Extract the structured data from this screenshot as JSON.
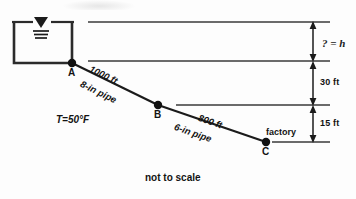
{
  "diagram": {
    "caption": "not to scale",
    "reservoir": {
      "name": "reservoir-tank",
      "water_surface_symbol": "water-surface-triangle",
      "temperature_label": "T=50°F"
    },
    "nodes": [
      {
        "id": "A",
        "label": "A",
        "x": 72,
        "y": 63
      },
      {
        "id": "B",
        "label": "B",
        "x": 158,
        "y": 105
      },
      {
        "id": "C",
        "label": "C",
        "x": 266,
        "y": 142
      }
    ],
    "pipes": [
      {
        "from": "A",
        "to": "B",
        "length_label": "1000 ft",
        "size_label": "8-in pipe"
      },
      {
        "from": "B",
        "to": "C",
        "length_label": "800 ft",
        "size_label": "6-in pipe"
      }
    ],
    "destination_label": "factory",
    "dimensions": [
      {
        "id": "head-unknown",
        "label": "? = h",
        "handwritten": true
      },
      {
        "id": "drop-a-b",
        "label": "30 ft",
        "handwritten": false
      },
      {
        "id": "drop-b-c",
        "label": "15 ft",
        "handwritten": false
      }
    ],
    "colors": {
      "ink": "#131313",
      "line": "#3a3a3a",
      "background": "#fdfdfd"
    }
  }
}
